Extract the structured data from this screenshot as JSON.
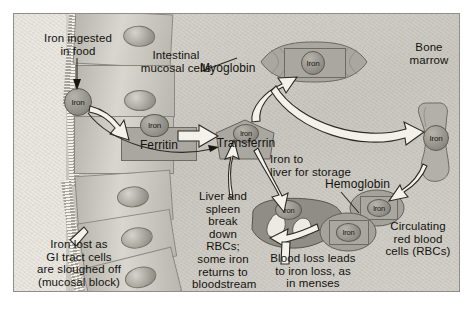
{
  "figure": {
    "frame_color": "#8e8e8e",
    "background_color": "#cfcdc6"
  },
  "labels": {
    "iron_ingested": "Iron ingested\nin food",
    "intestinal_mucosal_cells": "Intestinal\nmucosal cells",
    "ferritin": "Ferritin",
    "transferrin": "Transferrin",
    "myoglobin": "Myoglobin",
    "bone_marrow": "Bone\nmarrow",
    "iron_to_liver": "Iron to\nliver for storage",
    "hemoglobin": "Hemoglobin",
    "circulating_rbc": "Circulating\nred blood\ncells (RBCs)",
    "liver_spleen": "Liver and\nspleen\nbreak\ndown\nRBCs;\nsome iron\nreturns to\nbloodstream",
    "blood_loss": "Blood loss leads\nto iron loss, as\nin menses",
    "iron_lost": "Iron lost as\nGI tract cells\nare sloughed off\n(mucosal block)"
  },
  "iron_tokens": {
    "ingested": "Iron",
    "in_ferritin": "Iron",
    "in_transferrin": "Iron",
    "in_myoglobin": "Iron",
    "in_bone_marrow": "Iron",
    "in_liver": "Iron",
    "in_rbc_front": "Iron",
    "in_rbc_back": "Iron"
  },
  "colors": {
    "iron_token": "#8d8b83",
    "organ_fill": "#a9a7a0",
    "arrow_fill": "#f3f1ea",
    "arrow_stroke": "#2b2a26",
    "text": "#13120f"
  }
}
